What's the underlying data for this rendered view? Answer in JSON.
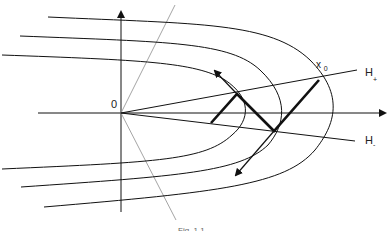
{
  "figure": {
    "labels": {
      "origin": "0",
      "x0_main": "x",
      "x0_sub": "0",
      "h_plus_main": "H",
      "h_plus_sub": "+",
      "h_minus_main": "H",
      "h_minus_sub": "-"
    },
    "caption": "Fig. 1.1"
  },
  "colors": {
    "stroke": "#111111",
    "gray_line": "#9a9a9a",
    "background": "#ffffff"
  }
}
